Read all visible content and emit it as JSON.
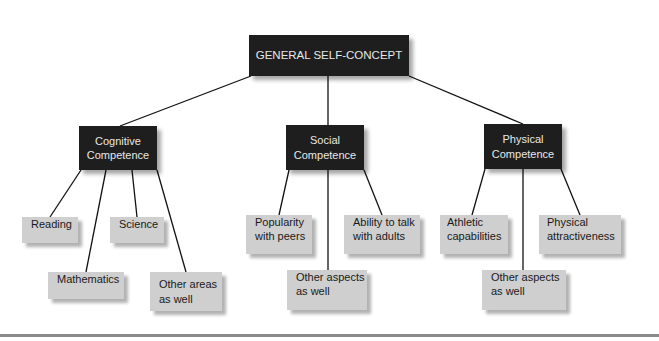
{
  "diagram": {
    "root": {
      "label": "GENERAL SELF-CONCEPT"
    },
    "categories": [
      {
        "label_line1": "Cognitive",
        "label_line2": "Competence",
        "children": [
          {
            "line1": "Reading",
            "line2": ""
          },
          {
            "line1": "Mathematics",
            "line2": ""
          },
          {
            "line1": "Science",
            "line2": ""
          },
          {
            "line1": "Other areas",
            "line2": "as well"
          }
        ]
      },
      {
        "label_line1": "Social",
        "label_line2": "Competence",
        "children": [
          {
            "line1": "Popularity",
            "line2": "with peers"
          },
          {
            "line1": "Other aspects",
            "line2": "as well"
          },
          {
            "line1": "Ability to talk",
            "line2": "with adults"
          }
        ]
      },
      {
        "label_line1": "Physical",
        "label_line2": "Competence",
        "children": [
          {
            "line1": "Athletic",
            "line2": "capabilities"
          },
          {
            "line1": "Other aspects",
            "line2": "as well"
          },
          {
            "line1": "Physical",
            "line2": "attractiveness"
          }
        ]
      }
    ],
    "colors": {
      "dark_box": "#1e1e1e",
      "light_box": "#cfcfcf",
      "line": "#111111",
      "rule": "#8a8a8a"
    }
  }
}
